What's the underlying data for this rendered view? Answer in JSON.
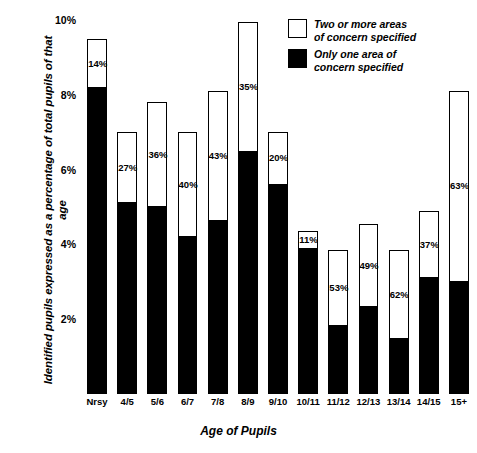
{
  "chart_data": {
    "type": "bar",
    "subtype": "stacked-bar",
    "title": "",
    "xlabel": "Age of Pupils",
    "ylabel": "Identified pupils expressed as a percentage of total pupils of that age",
    "ylim": [
      0,
      10
    ],
    "yticks": [
      "2%",
      "4%",
      "6%",
      "8%",
      "10%"
    ],
    "ytick_values": [
      2,
      4,
      6,
      8,
      10
    ],
    "grid": false,
    "legend_position": "top-right",
    "categories": [
      "Nrsy",
      "4/5",
      "5/6",
      "6/7",
      "7/8",
      "8/9",
      "9/10",
      "10/11",
      "11/12",
      "12/13",
      "13/14",
      "14/15",
      "15+"
    ],
    "series": [
      {
        "name": "Only one area of concern specified",
        "color": "#000000",
        "values": [
          8.17,
          5.11,
          4.99,
          4.2,
          4.62,
          6.47,
          5.6,
          3.89,
          1.81,
          2.32,
          1.46,
          3.09,
          3.0
        ]
      },
      {
        "name": "Two or more areas of concern specified",
        "color": "#ffffff",
        "values": [
          1.33,
          1.89,
          2.81,
          2.8,
          3.48,
          3.48,
          1.4,
          0.48,
          2.04,
          2.23,
          2.39,
          1.81,
          5.1
        ]
      }
    ],
    "totals": [
      9.5,
      7.0,
      7.8,
      7.0,
      8.1,
      9.95,
      7.0,
      4.37,
      3.85,
      4.55,
      3.85,
      4.9,
      8.1
    ],
    "data_labels": [
      "14%",
      "27%",
      "36%",
      "40%",
      "43%",
      "35%",
      "20%",
      "11%",
      "53%",
      "49%",
      "62%",
      "37%",
      "63%"
    ],
    "data_label_note": "percentage of the bar that is 'two or more areas of concern specified'"
  },
  "legend": {
    "items": [
      {
        "swatch": "empty",
        "line1": "Two or more areas",
        "line2": "of concern specified"
      },
      {
        "swatch": "filled",
        "line1": "Only one area of",
        "line2": "concern specified"
      }
    ]
  }
}
